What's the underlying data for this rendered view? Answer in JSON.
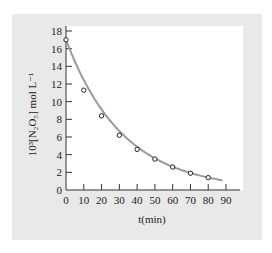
{
  "chart_data": {
    "type": "scatter",
    "title": "",
    "xlabel": "t(min)",
    "ylabel": "10³[N₂O₅]  mol L⁻¹",
    "xlim": [
      0,
      90
    ],
    "ylim": [
      0,
      18
    ],
    "x_ticks": [
      0,
      10,
      20,
      30,
      40,
      50,
      60,
      70,
      80,
      90
    ],
    "y_ticks": [
      0,
      2,
      4,
      6,
      8,
      10,
      12,
      14,
      16,
      18
    ],
    "grid": false,
    "legend": null,
    "series": [
      {
        "name": "measured",
        "style": "open-circle markers",
        "x": [
          0,
          10,
          20,
          30,
          40,
          50,
          60,
          70,
          80
        ],
        "y": [
          17.0,
          11.3,
          8.4,
          6.2,
          4.6,
          3.5,
          2.6,
          1.9,
          1.4
        ]
      },
      {
        "name": "fitted curve",
        "style": "gray smooth line",
        "x": [
          0,
          88
        ],
        "y": [
          17.0,
          1.1
        ]
      }
    ],
    "colors": {
      "panel": "#e9e9e9",
      "plot_bg": "#ffffff",
      "curve": "#9a9a9a",
      "axis": "#333333"
    }
  }
}
